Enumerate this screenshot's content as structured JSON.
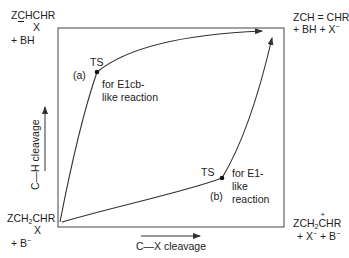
{
  "diagram": {
    "type": "reaction-coordinate-diagram",
    "corners": {
      "top_left": {
        "line1_pre": "Z",
        "line1_charged": "C",
        "line1_post": "HCHR",
        "line2": "X",
        "line3": "+ BH",
        "charge": "-"
      },
      "top_right": {
        "line1": "ZCH = CHR",
        "line2_a": "+ BH + X",
        "line2_sup": "−"
      },
      "bottom_left": {
        "line1_a": "ZCH",
        "line1_sub": "2",
        "line1_b": "CHR",
        "line2": "X",
        "line3_a": "+ B",
        "line3_sup": "−"
      },
      "bottom_right": {
        "line1_a": "ZCH",
        "line1_sub": "2",
        "line1_charged": "C",
        "line1_plus": "+",
        "line1_b": "HR",
        "line2_a": "+ X",
        "line2_sup1": "−",
        "line2_b": " + B",
        "line2_sup2": "−"
      }
    },
    "axes": {
      "x_label": "C—X cleavage",
      "y_label": "C—H cleavage"
    },
    "paths": [
      {
        "id": "a",
        "marker": "(a)",
        "ts_label": "TS",
        "note_line1": "for E1cb-",
        "note_line2": "like reaction"
      },
      {
        "id": "b",
        "marker": "(b)",
        "ts_label": "TS",
        "note_line1": "for E1-",
        "note_line2": "like",
        "note_line3": "reaction"
      }
    ],
    "colors": {
      "line": "#333333",
      "text": "#222222",
      "background": "#ffffff"
    }
  }
}
